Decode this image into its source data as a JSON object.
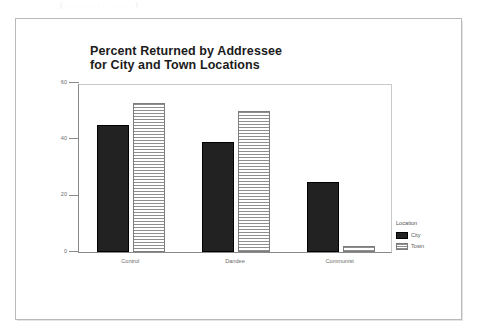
{
  "figure": {
    "top_crop_text": "( . . . . . . . . . . . . . . .  )",
    "title_line1": "Percent Returned by Addressee",
    "title_line2": "for City and Town Locations"
  },
  "legend": {
    "title": "Location",
    "entries": [
      {
        "label": "City",
        "swatch": "solid-black-swatch",
        "color": "#222222"
      },
      {
        "label": "Town",
        "swatch": "horizontal-hatch-swatch",
        "color": "#8e8e8e"
      }
    ]
  },
  "axes": {
    "y_ticks": [
      "0",
      "20",
      "40",
      "60"
    ],
    "x_tick_labels": [
      "Control",
      "Dandee",
      "Communist"
    ]
  },
  "chart_data": {
    "type": "bar",
    "title": "Percent Returned by Addressee for City and Town Locations",
    "xlabel": "",
    "ylabel": "",
    "categories": [
      "Control",
      "Dandee",
      "Communist"
    ],
    "series": [
      {
        "name": "City",
        "values": [
          45,
          39,
          25
        ],
        "color": "#222222"
      },
      {
        "name": "Town",
        "values": [
          53,
          50,
          2
        ],
        "color": "#8e8e8e"
      }
    ],
    "ylim": [
      0,
      60
    ],
    "yticks": [
      0,
      20,
      40,
      60
    ],
    "grid": false,
    "legend_position": "right",
    "legend_title": "Location"
  }
}
